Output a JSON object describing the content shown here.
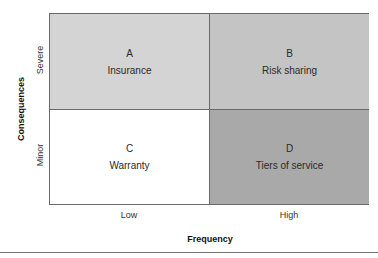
{
  "chart": {
    "x_axis_title": "Frequency",
    "y_axis_title": "Consequences",
    "x_levels": [
      "Low",
      "High"
    ],
    "y_levels": [
      "Severe",
      "Minor"
    ],
    "quadrants": [
      {
        "id": "A",
        "label": "Insurance",
        "position": "top-left",
        "color": "#d4d4d4"
      },
      {
        "id": "B",
        "label": "Risk sharing",
        "position": "top-right",
        "color": "#c4c4c4"
      },
      {
        "id": "C",
        "label": "Warranty",
        "position": "bottom-left",
        "color": "#ffffff"
      },
      {
        "id": "D",
        "label": "Tiers of service",
        "position": "bottom-right",
        "color": "#a9a9a9"
      }
    ]
  }
}
